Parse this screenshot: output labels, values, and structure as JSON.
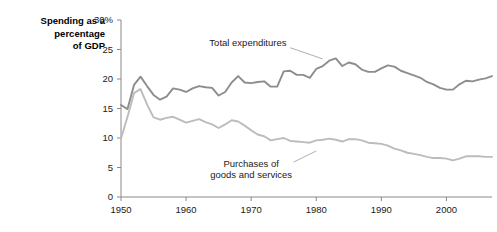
{
  "chart_data": {
    "type": "line",
    "title_lines": [
      "Spending as a",
      "percentage",
      "of GDP"
    ],
    "xlabel": "",
    "ylabel": "Spending as a percentage of GDP",
    "xlim": [
      1950,
      2007
    ],
    "ylim": [
      0,
      30
    ],
    "grid": false,
    "legend_position": "inline-annotations",
    "x_ticks": [
      1950,
      1960,
      1970,
      1980,
      1990,
      2000
    ],
    "x_tick_labels": [
      "1950",
      "1960",
      "1970",
      "1980",
      "1990",
      "2000"
    ],
    "y_ticks": [
      0,
      5,
      10,
      15,
      20,
      25,
      30
    ],
    "y_tick_labels": [
      "0",
      "5",
      "10",
      "15",
      "20",
      "25",
      "30%"
    ],
    "x": [
      1950,
      1951,
      1952,
      1953,
      1954,
      1955,
      1956,
      1957,
      1958,
      1959,
      1960,
      1961,
      1962,
      1963,
      1964,
      1965,
      1966,
      1967,
      1968,
      1969,
      1970,
      1971,
      1972,
      1973,
      1974,
      1975,
      1976,
      1977,
      1978,
      1979,
      1980,
      1981,
      1982,
      1983,
      1984,
      1985,
      1986,
      1987,
      1988,
      1989,
      1990,
      1991,
      1992,
      1993,
      1994,
      1995,
      1996,
      1997,
      1998,
      1999,
      2000,
      2001,
      2002,
      2003,
      2004,
      2005,
      2006,
      2007
    ],
    "series": [
      {
        "name": "Total expenditures",
        "color": "#8d8d8d",
        "label_x": 1969.5,
        "label_y": 25.6,
        "leader": [
          [
            1976.0,
            25.3
          ],
          [
            1981.0,
            23.4
          ]
        ],
        "values": [
          15.6,
          14.9,
          19.0,
          20.4,
          18.8,
          17.3,
          16.5,
          17.0,
          18.4,
          18.2,
          17.8,
          18.4,
          18.8,
          18.6,
          18.5,
          17.2,
          17.8,
          19.4,
          20.5,
          19.4,
          19.3,
          19.5,
          19.6,
          18.7,
          18.7,
          21.3,
          21.4,
          20.7,
          20.7,
          20.2,
          21.7,
          22.2,
          23.1,
          23.5,
          22.2,
          22.8,
          22.5,
          21.6,
          21.2,
          21.2,
          21.8,
          22.3,
          22.1,
          21.4,
          21.0,
          20.6,
          20.2,
          19.5,
          19.1,
          18.5,
          18.2,
          18.2,
          19.1,
          19.7,
          19.6,
          19.9,
          20.1,
          20.5
        ]
      },
      {
        "name": "Purchases of goods and services",
        "color": "#bcbcbc",
        "label_lines": [
          "Purchases of",
          "goods and services"
        ],
        "label_x": 1970.0,
        "label_y": 5.1,
        "leader": [
          [
            1976.5,
            5.9
          ],
          [
            1980.0,
            7.8
          ]
        ],
        "values": [
          9.9,
          13.6,
          17.6,
          18.3,
          15.7,
          13.5,
          13.1,
          13.4,
          13.6,
          13.1,
          12.6,
          12.9,
          13.2,
          12.7,
          12.3,
          11.7,
          12.3,
          13.0,
          12.8,
          12.1,
          11.3,
          10.6,
          10.3,
          9.6,
          9.8,
          10.0,
          9.5,
          9.4,
          9.3,
          9.2,
          9.6,
          9.7,
          9.9,
          9.7,
          9.4,
          9.8,
          9.8,
          9.6,
          9.2,
          9.1,
          9.0,
          8.7,
          8.2,
          7.9,
          7.5,
          7.3,
          7.1,
          6.8,
          6.6,
          6.6,
          6.5,
          6.2,
          6.5,
          6.9,
          6.9,
          6.9,
          6.8,
          6.8
        ]
      }
    ]
  }
}
